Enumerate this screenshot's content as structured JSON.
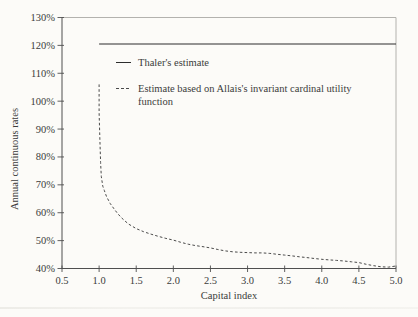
{
  "figure": {
    "background": "#fcfbf8",
    "text_color": "#3b3b3b",
    "axis_color": "#4f4f4f",
    "frame_light_color": "#b3b2ae"
  },
  "chart_data": {
    "type": "line",
    "title": "",
    "xlabel": "Capital index",
    "ylabel": "Annual continuous rates",
    "xlim": [
      0.5,
      5.0
    ],
    "ylim": [
      40,
      130
    ],
    "grid": false,
    "legend_position": "upper-left-inside",
    "x_ticks": [
      {
        "v": 0.5,
        "label": "0.5"
      },
      {
        "v": 1.0,
        "label": "1.0"
      },
      {
        "v": 1.5,
        "label": "1.5"
      },
      {
        "v": 2.0,
        "label": "2.0"
      },
      {
        "v": 2.5,
        "label": "2.5"
      },
      {
        "v": 3.0,
        "label": "3.0"
      },
      {
        "v": 3.5,
        "label": "3.5"
      },
      {
        "v": 4.0,
        "label": "4.0"
      },
      {
        "v": 4.5,
        "label": "4.5"
      },
      {
        "v": 5.0,
        "label": "5.0"
      }
    ],
    "y_ticks": [
      {
        "v": 40,
        "label": "40%"
      },
      {
        "v": 50,
        "label": "50%"
      },
      {
        "v": 60,
        "label": "60%"
      },
      {
        "v": 70,
        "label": "70%"
      },
      {
        "v": 80,
        "label": "80%"
      },
      {
        "v": 90,
        "label": "90%"
      },
      {
        "v": 100,
        "label": "100%"
      },
      {
        "v": 110,
        "label": "110%"
      },
      {
        "v": 120,
        "label": "120%"
      },
      {
        "v": 130,
        "label": "130%"
      }
    ],
    "series": [
      {
        "name": "Thaler's estimate",
        "line_style": "solid",
        "color": "#2d2d2d",
        "points": [
          [
            1.0,
            120.5
          ],
          [
            5.0,
            120.5
          ]
        ]
      },
      {
        "name": "Estimate based on Allais's invariant cardinal utility function",
        "line_style": "dashed",
        "color": "#4a4a4a",
        "points": [
          [
            1.0,
            106.0
          ],
          [
            1.0,
            96.0
          ],
          [
            1.01,
            86.0
          ],
          [
            1.02,
            78.0
          ],
          [
            1.03,
            73.0
          ],
          [
            1.05,
            69.5
          ],
          [
            1.07,
            68.0
          ],
          [
            1.1,
            65.8
          ],
          [
            1.15,
            63.3
          ],
          [
            1.2,
            61.4
          ],
          [
            1.25,
            59.7
          ],
          [
            1.3,
            58.2
          ],
          [
            1.35,
            57.0
          ],
          [
            1.4,
            55.9
          ],
          [
            1.5,
            54.3
          ],
          [
            1.6,
            53.2
          ],
          [
            1.7,
            52.3
          ],
          [
            1.8,
            51.5
          ],
          [
            1.9,
            50.8
          ],
          [
            2.0,
            50.2
          ],
          [
            2.1,
            49.4
          ],
          [
            2.2,
            48.7
          ],
          [
            2.3,
            48.2
          ],
          [
            2.4,
            47.8
          ],
          [
            2.5,
            47.4
          ],
          [
            2.6,
            46.8
          ],
          [
            2.7,
            46.3
          ],
          [
            2.8,
            46.0
          ],
          [
            2.9,
            45.8
          ],
          [
            3.0,
            45.7
          ],
          [
            3.1,
            45.6
          ],
          [
            3.2,
            45.6
          ],
          [
            3.3,
            45.4
          ],
          [
            3.4,
            45.1
          ],
          [
            3.5,
            44.8
          ],
          [
            3.6,
            44.5
          ],
          [
            3.7,
            44.2
          ],
          [
            3.8,
            43.9
          ],
          [
            3.9,
            43.6
          ],
          [
            4.0,
            43.3
          ],
          [
            4.1,
            43.1
          ],
          [
            4.2,
            42.9
          ],
          [
            4.3,
            42.7
          ],
          [
            4.4,
            42.4
          ],
          [
            4.5,
            42.1
          ],
          [
            4.6,
            41.5
          ],
          [
            4.7,
            41.0
          ],
          [
            4.8,
            40.6
          ],
          [
            4.9,
            40.5
          ],
          [
            5.0,
            40.9
          ]
        ]
      }
    ]
  }
}
